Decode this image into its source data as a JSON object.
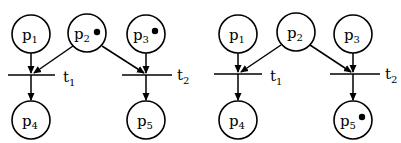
{
  "diagram": {
    "type": "petri-net-firing",
    "nets": [
      {
        "name": "before",
        "places": [
          {
            "id": "p1",
            "base": "p",
            "sub": "1",
            "tokens": 0
          },
          {
            "id": "p2",
            "base": "p",
            "sub": "2",
            "tokens": 1
          },
          {
            "id": "p3",
            "base": "p",
            "sub": "3",
            "tokens": 1
          },
          {
            "id": "p4",
            "base": "p",
            "sub": "4",
            "tokens": 0
          },
          {
            "id": "p5",
            "base": "p",
            "sub": "5",
            "tokens": 0
          }
        ],
        "transitions": [
          {
            "id": "t1",
            "base": "t",
            "sub": "1"
          },
          {
            "id": "t2",
            "base": "t",
            "sub": "2"
          }
        ],
        "arcs": [
          {
            "from": "p1",
            "to": "t1"
          },
          {
            "from": "p2",
            "to": "t1"
          },
          {
            "from": "p2",
            "to": "t2"
          },
          {
            "from": "p3",
            "to": "t2"
          },
          {
            "from": "t1",
            "to": "p4"
          },
          {
            "from": "t2",
            "to": "p5"
          }
        ]
      },
      {
        "name": "after",
        "places": [
          {
            "id": "p1",
            "base": "p",
            "sub": "1",
            "tokens": 0
          },
          {
            "id": "p2",
            "base": "p",
            "sub": "2",
            "tokens": 0
          },
          {
            "id": "p3",
            "base": "p",
            "sub": "3",
            "tokens": 0
          },
          {
            "id": "p4",
            "base": "p",
            "sub": "4",
            "tokens": 0
          },
          {
            "id": "p5",
            "base": "p",
            "sub": "5",
            "tokens": 1
          }
        ],
        "transitions": [
          {
            "id": "t1",
            "base": "t",
            "sub": "1"
          },
          {
            "id": "t2",
            "base": "t",
            "sub": "2"
          }
        ],
        "arcs": [
          {
            "from": "p1",
            "to": "t1"
          },
          {
            "from": "p2",
            "to": "t1"
          },
          {
            "from": "p2",
            "to": "t2"
          },
          {
            "from": "p3",
            "to": "t2"
          },
          {
            "from": "t1",
            "to": "p4"
          },
          {
            "from": "t2",
            "to": "p5"
          }
        ]
      }
    ]
  }
}
